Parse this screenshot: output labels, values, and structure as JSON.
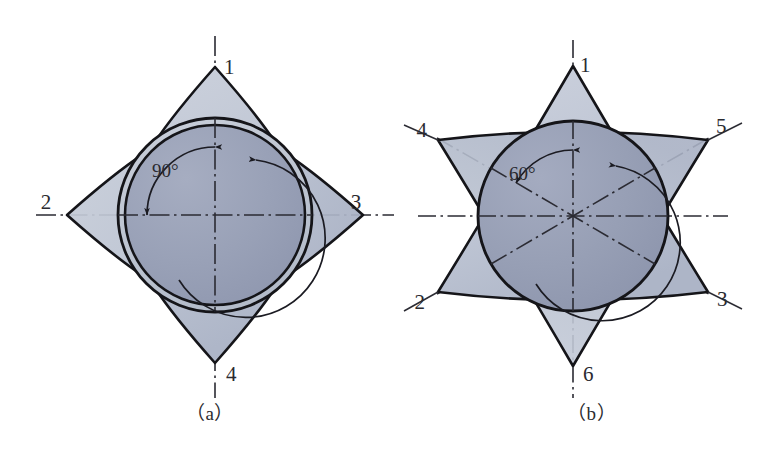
{
  "figure": {
    "background_color": "#ffffff",
    "panels": [
      {
        "id": "a",
        "caption": "（a）",
        "shape": "four-pointed-star",
        "angle_label": "90°",
        "angle_value": 90,
        "lobes": 4,
        "center": {
          "x": 215,
          "y": 215
        },
        "outer_radius": 148,
        "ring_outer_radius": 97,
        "ring_inner_radius": 90,
        "arc_radius": 68,
        "labels": [
          {
            "text": "1",
            "position": "top",
            "x": 224,
            "y": 74
          },
          {
            "text": "2",
            "position": "left",
            "x": 46,
            "y": 209
          },
          {
            "text": "3",
            "position": "right",
            "x": 356,
            "y": 209
          },
          {
            "text": "4",
            "position": "bottom",
            "x": 226,
            "y": 381
          }
        ],
        "axes": [
          {
            "name": "vertical-center-line",
            "angle_deg": 90
          },
          {
            "name": "horizontal-center-line",
            "angle_deg": 0
          }
        ],
        "colors": {
          "lobe_light": "#c4cad7",
          "lobe_mid": "#b3bbcb",
          "disc_dark": "#9aa2b8",
          "outline": "#151519",
          "axis": "#2b2b33"
        }
      },
      {
        "id": "b",
        "caption": "（b）",
        "shape": "six-pointed-star",
        "angle_label": "60°",
        "angle_value": 60,
        "lobes": 6,
        "center": {
          "x": 573,
          "y": 216
        },
        "outer_radius": 150,
        "ring_outer_radius": 95,
        "ring_inner_radius": 88,
        "arc_radius": 66,
        "labels": [
          {
            "text": "1",
            "position": "top",
            "x": 580,
            "y": 72
          },
          {
            "text": "4",
            "position": "upper-left",
            "x": 427,
            "y": 137
          },
          {
            "text": "5",
            "position": "upper-right",
            "x": 716,
            "y": 133
          },
          {
            "text": "2",
            "position": "lower-left",
            "x": 425,
            "y": 309
          },
          {
            "text": "3",
            "position": "lower-right",
            "x": 717,
            "y": 306
          },
          {
            "text": "6",
            "position": "bottom",
            "x": 583,
            "y": 381
          }
        ],
        "axes": [
          {
            "name": "vertical-center-line",
            "angle_deg": 90
          },
          {
            "name": "horizontal-center-line",
            "angle_deg": 0
          },
          {
            "name": "diagonal-up-right-line",
            "angle_deg": 30
          },
          {
            "name": "diagonal-up-left-line",
            "angle_deg": 150
          }
        ],
        "colors": {
          "lobe_light": "#c6ccd9",
          "lobe_mid": "#b2bacb",
          "disc_dark": "#98a0b6",
          "outline": "#151519",
          "axis": "#2b2b33"
        }
      }
    ]
  }
}
